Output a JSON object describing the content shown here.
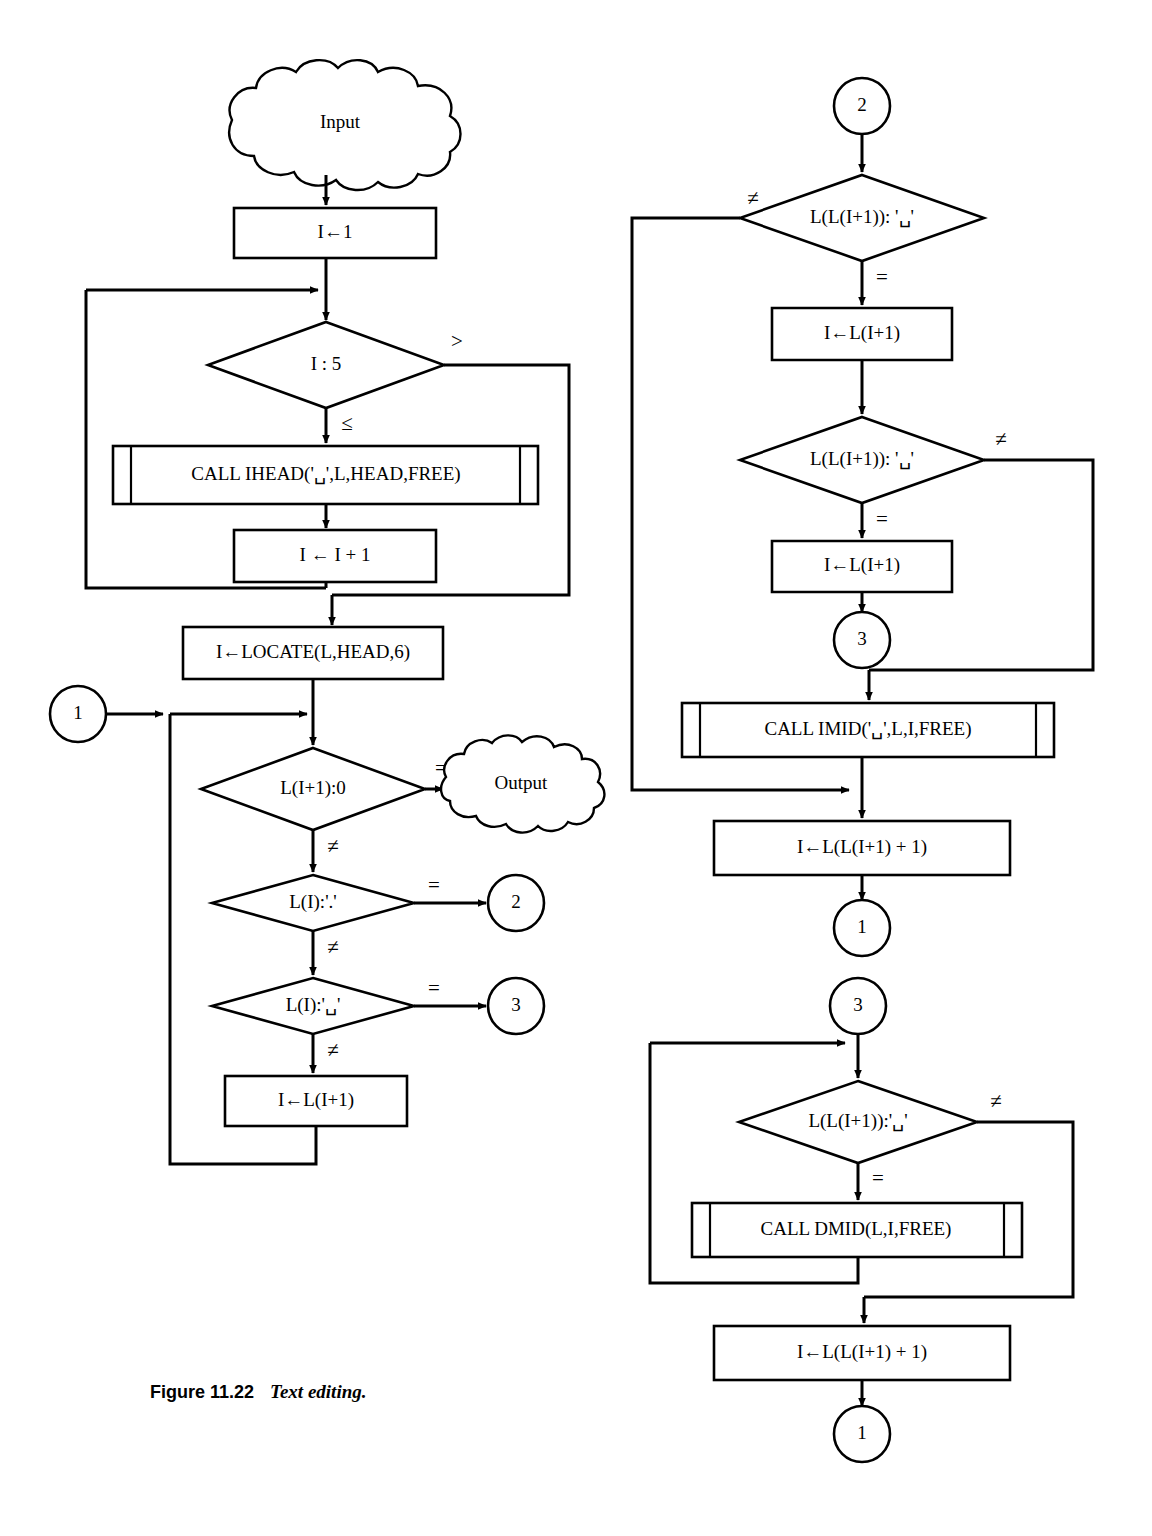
{
  "figure": {
    "caption_label": "Figure 11.22",
    "caption_title": "Text editing."
  },
  "diagram": {
    "type": "flowchart",
    "title": "Text editing",
    "left_column": {
      "input_cloud": "Input",
      "init_box": "I←1",
      "loop_decision": "I : 5",
      "loop_decision_yes_label": "≤",
      "loop_decision_no_label": ">",
      "call_ihead": "CALL IHEAD('␣',L,HEAD,FREE)",
      "increment_box": "I ← I + 1",
      "locate_box": "I←LOCATE(L,HEAD,6)",
      "connector_in": "1",
      "dec_end": "L(I+1):0",
      "dec_end_eq": "=",
      "dec_end_ne": "≠",
      "output_cloud": "Output",
      "dec_period": "L(I):'.'",
      "dec_period_eq": "=",
      "dec_period_ne": "≠",
      "dec_period_target": "2",
      "dec_blank": "L(I):'␣'",
      "dec_blank_eq": "=",
      "dec_blank_ne": "≠",
      "dec_blank_target": "3",
      "advance_box": "I←L(I+1)"
    },
    "right_column_top": {
      "connector_in": "2",
      "dec1": "L(L(I+1)): '␣'",
      "dec1_ne": "≠",
      "dec1_eq": "=",
      "assign1": "I←L(I+1)",
      "dec2": "L(L(I+1)): '␣'",
      "dec2_ne": "≠",
      "dec2_eq": "=",
      "assign2": "I←L(I+1)",
      "connector_mid": "3",
      "call_imid": "CALL IMID('␣',L,I,FREE)",
      "assign3": "I←L(L(I+1) + 1)",
      "connector_out": "1"
    },
    "right_column_bottom": {
      "connector_in": "3",
      "dec1": "L(L(I+1)):'␣'",
      "dec1_ne": "≠",
      "dec1_eq": "=",
      "call_dmid": "CALL DMID(L,I,FREE)",
      "assign1": "I←L(L(I+1) + 1)",
      "connector_out": "1"
    }
  },
  "colors": {
    "stroke": "#000000",
    "fill": "#ffffff",
    "background": "#ffffff"
  }
}
